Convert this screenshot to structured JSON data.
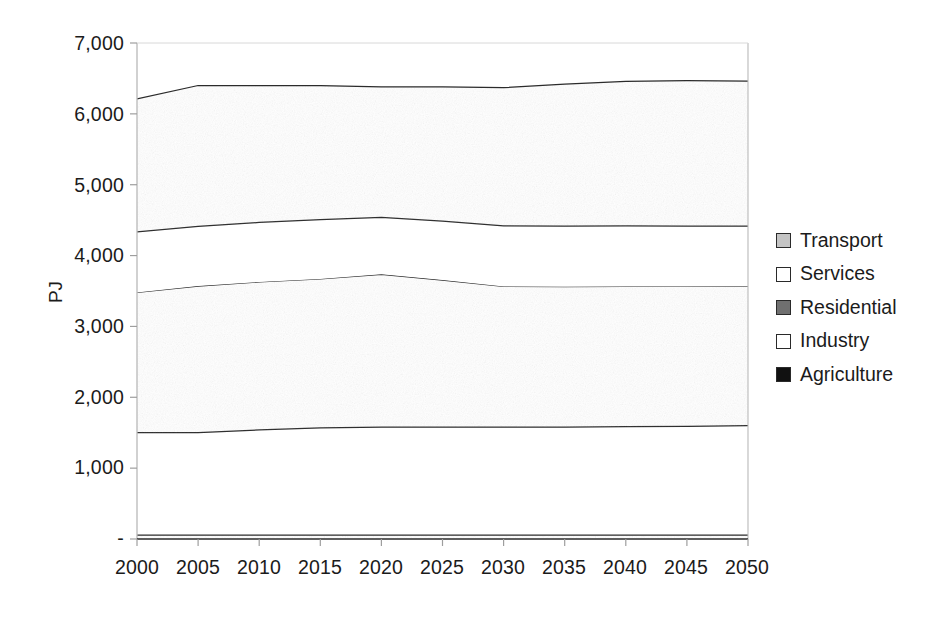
{
  "chart_data": {
    "type": "area",
    "stacked": true,
    "title": "",
    "xlabel": "",
    "ylabel": "PJ",
    "x": [
      2000,
      2005,
      2010,
      2015,
      2020,
      2025,
      2030,
      2035,
      2040,
      2045,
      2050
    ],
    "xtick_labels": [
      "2000",
      "2005",
      "2010",
      "2015",
      "2020",
      "2025",
      "2030",
      "2035",
      "2040",
      "2045",
      "2050"
    ],
    "ytick_labels": [
      "-",
      "1,000",
      "2,000",
      "3,000",
      "4,000",
      "5,000",
      "6,000",
      "7,000"
    ],
    "ytick_values": [
      0,
      1000,
      2000,
      3000,
      4000,
      5000,
      6000,
      7000
    ],
    "ylim": [
      0,
      7000
    ],
    "xlim": [
      2000,
      2050
    ],
    "grid": false,
    "legend_position": "right",
    "stack_order_bottom_to_top": [
      "Agriculture",
      "Industry",
      "Residential",
      "Services",
      "Transport"
    ],
    "series": [
      {
        "name": "Agriculture",
        "color": "#111111",
        "values": [
          62,
          62,
          62,
          62,
          62,
          62,
          62,
          62,
          62,
          62,
          62
        ]
      },
      {
        "name": "Industry",
        "color": "#ffffff",
        "values": [
          1438,
          1440,
          1478,
          1508,
          1518,
          1518,
          1518,
          1518,
          1523,
          1528,
          1538
        ]
      },
      {
        "name": "Residential",
        "color": "#707070",
        "values": [
          1980,
          2068,
          2087,
          2100,
          2155,
          2075,
          1985,
          1980,
          1980,
          1975,
          1968
        ]
      },
      {
        "name": "Services",
        "color": "#ffffff",
        "values": [
          855,
          843,
          840,
          838,
          805,
          830,
          855,
          855,
          853,
          850,
          848
        ]
      },
      {
        "name": "Transport",
        "color": "#c4c4c4",
        "values": [
          1875,
          1987,
          1933,
          1892,
          1840,
          1895,
          1950,
          2005,
          2042,
          2055,
          2045
        ]
      }
    ],
    "cumulative_totals": [
      6210,
      6400,
      6400,
      6400,
      6380,
      6380,
      6370,
      6420,
      6460,
      6470,
      6461
    ]
  },
  "legend": {
    "items": [
      {
        "label": "Transport",
        "color": "#c4c4c4"
      },
      {
        "label": "Services",
        "color": "#ffffff"
      },
      {
        "label": "Residential",
        "color": "#707070"
      },
      {
        "label": "Industry",
        "color": "#ffffff"
      },
      {
        "label": "Agriculture",
        "color": "#111111"
      }
    ]
  },
  "axes": {
    "y_title": "PJ",
    "y_ticks": [
      "7,000",
      "6,000",
      "5,000",
      "4,000",
      "3,000",
      "2,000",
      "1,000",
      "-"
    ],
    "x_ticks": [
      "2000",
      "2005",
      "2010",
      "2015",
      "2020",
      "2025",
      "2030",
      "2035",
      "2040",
      "2045",
      "2050"
    ]
  }
}
